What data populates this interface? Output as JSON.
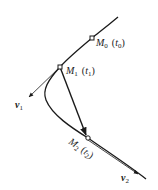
{
  "diagram": {
    "type": "curve-velocity-diagram",
    "colors": {
      "stroke": "#1a1a1a",
      "background": "#ffffff"
    },
    "points": [
      {
        "id": "M0",
        "label_main": "M",
        "label_sub": "0",
        "param_main": "t",
        "param_sub": "0"
      },
      {
        "id": "M1",
        "label_main": "M",
        "label_sub": "1",
        "param_main": "t",
        "param_sub": "1"
      },
      {
        "id": "M2",
        "label_main": "M",
        "label_sub": "2",
        "param_main": "t",
        "param_sub": "2"
      }
    ],
    "vectors": [
      {
        "id": "v1",
        "main": "v",
        "sub": "1"
      },
      {
        "id": "v2",
        "main": "v",
        "sub": "2"
      }
    ]
  }
}
